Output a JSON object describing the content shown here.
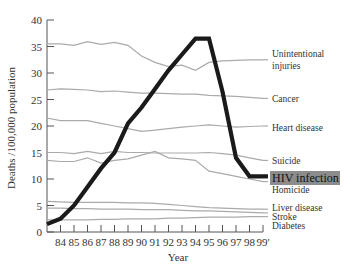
{
  "chart_data": {
    "type": "line",
    "title": "",
    "xlabel": "Year",
    "ylabel": "Deaths /100,000 population",
    "ylim": [
      0,
      40
    ],
    "yticks": [
      0,
      5,
      10,
      15,
      20,
      25,
      30,
      35,
      40
    ],
    "x": [
      83,
      84,
      85,
      86,
      87,
      88,
      89,
      90,
      91,
      92,
      93,
      94,
      95,
      96,
      97,
      98,
      99
    ],
    "xtick_labels": [
      "84",
      "85",
      "86",
      "87",
      "88",
      "89",
      "90",
      "91",
      "92",
      "93",
      "94",
      "95",
      "96",
      "97",
      "98",
      "99'"
    ],
    "grid": false,
    "legend_position": "right-inline",
    "series": [
      {
        "name": "Unintentional injuries",
        "color": "#aaaaaa",
        "values": [
          35.5,
          35.5,
          35.2,
          35.9,
          35.4,
          35.8,
          35.2,
          33.2,
          32.0,
          31.2,
          31.5,
          30.5,
          32.0,
          32.3,
          32.4,
          32.5,
          32.5
        ]
      },
      {
        "name": "Cancer",
        "color": "#aaaaaa",
        "values": [
          26.8,
          27.0,
          26.9,
          26.8,
          26.5,
          26.6,
          26.4,
          26.2,
          26.2,
          26.1,
          26.0,
          26.0,
          25.8,
          25.7,
          25.6,
          25.4,
          25.2
        ]
      },
      {
        "name": "Heart disease",
        "color": "#aaaaaa",
        "values": [
          21.5,
          21.0,
          21.0,
          21.0,
          20.5,
          20.0,
          19.5,
          19.0,
          19.2,
          19.5,
          19.8,
          20.0,
          20.2,
          20.0,
          19.8,
          19.9,
          20.0
        ]
      },
      {
        "name": "Suicide",
        "color": "#aaaaaa",
        "values": [
          15.0,
          15.0,
          14.8,
          15.2,
          14.8,
          15.2,
          15.0,
          15.0,
          14.9,
          14.9,
          14.9,
          14.9,
          15.0,
          14.8,
          14.5,
          14.0,
          13.5
        ]
      },
      {
        "name": "Homicide",
        "color": "#aaaaaa",
        "values": [
          13.5,
          13.3,
          13.3,
          14.0,
          13.0,
          13.5,
          13.8,
          14.5,
          15.2,
          14.0,
          13.8,
          13.5,
          11.5,
          11.0,
          10.5,
          10.0,
          9.5
        ]
      },
      {
        "name": "Liver disease",
        "color": "#aaaaaa",
        "values": [
          5.8,
          5.7,
          5.6,
          5.6,
          5.6,
          5.6,
          5.5,
          5.5,
          5.4,
          5.2,
          5.0,
          4.8,
          4.6,
          4.5,
          4.4,
          4.3,
          4.3
        ]
      },
      {
        "name": "Stroke",
        "color": "#aaaaaa",
        "values": [
          4.5,
          4.5,
          4.4,
          4.4,
          4.3,
          4.3,
          4.3,
          4.2,
          4.2,
          4.2,
          4.1,
          4.0,
          4.0,
          3.9,
          3.8,
          3.7,
          3.6
        ]
      },
      {
        "name": "Diabetes",
        "color": "#aaaaaa",
        "values": [
          2.3,
          2.3,
          2.3,
          2.3,
          2.4,
          2.4,
          2.5,
          2.5,
          2.5,
          2.6,
          2.6,
          2.7,
          2.8,
          2.8,
          2.8,
          2.9,
          2.9
        ]
      },
      {
        "name": "HIV infection",
        "color": "#1a1a1a",
        "values": [
          1.5,
          2.5,
          5.0,
          8.5,
          12.0,
          15.0,
          20.5,
          23.5,
          27.0,
          30.5,
          33.5,
          36.5,
          36.5,
          26.5,
          14.0,
          10.5,
          10.5
        ],
        "highlighted": true
      }
    ]
  },
  "labels": {
    "unintentional_1": "Unintentional",
    "unintentional_2": "injuries",
    "cancer": "Cancer",
    "heart": "Heart disease",
    "suicide": "Suicide",
    "hiv": "HIV infection",
    "homicide": "Homicide",
    "liver": "Liver disease",
    "stroke": "Stroke",
    "diabetes": "Diabetes"
  },
  "style": {
    "hiv_label_bg": "#8c8c8c",
    "other_line_color": "#aaaaaa",
    "hiv_line_color": "#1a1a1a",
    "axis_color": "#555555"
  }
}
